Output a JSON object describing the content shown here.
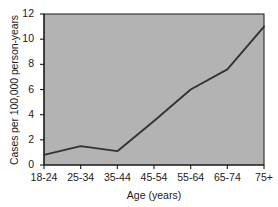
{
  "chart_data": {
    "type": "line",
    "title": "",
    "xlabel": "Age (years)",
    "ylabel": "Cases per 100,000 person-years",
    "categories": [
      "18-24",
      "25-34",
      "35-44",
      "45-54",
      "55-64",
      "65-74",
      "75+"
    ],
    "values": [
      0.8,
      1.5,
      1.1,
      3.5,
      6.0,
      7.6,
      11.0
    ],
    "series": [
      {
        "name": "Incidence rate",
        "values": [
          0.8,
          1.5,
          1.1,
          3.5,
          6.0,
          7.6,
          11.0
        ]
      }
    ],
    "ylim": [
      0,
      12
    ],
    "yticks": [
      0,
      2,
      4,
      6,
      8,
      10,
      12
    ],
    "ytick_labels": [
      "0",
      "2",
      "4",
      "6",
      "8",
      "10",
      "12"
    ],
    "xtick_labels": [
      "18-24",
      "25-34",
      "35-44",
      "45-54",
      "55-64",
      "65-74",
      "75+"
    ],
    "grid": false,
    "legend": false,
    "legend_position": "none",
    "colors": {
      "line": "#333333",
      "plot_background": "#b3b3b3",
      "figure_background": "#ffffff",
      "axis": "#1a1a1a",
      "text": "#1a1a1a"
    }
  }
}
